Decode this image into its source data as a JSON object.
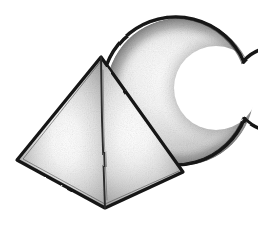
{
  "artwork": {
    "title": "Pencil sketch of a pyramid and a crescent moon",
    "medium": "graphite pencil drawing",
    "background_color": "#ffffff",
    "ink_color": "#1a1a1a",
    "canvas": {
      "width": 258,
      "height": 225
    },
    "objects": [
      {
        "name": "crescent-moon",
        "label": "Crescent moon",
        "description": "Thick crescent opening to the right, drawn behind the pyramid",
        "fill_light": "#fdfdfd",
        "fill_mid": "#cfcfcf",
        "fill_dark": "#9a9a9a",
        "outline_color": "#141414",
        "outline_width": 3.4,
        "outer_circle": {
          "cx": 180,
          "cy": 92,
          "r": 74
        },
        "inner_circle": {
          "cx": 216,
          "cy": 88,
          "r": 42
        },
        "horn_upper_tip": {
          "x": 246,
          "y": 62
        },
        "horn_lower_tip": {
          "x": 244,
          "y": 118
        }
      },
      {
        "name": "pyramid",
        "label": "Square pyramid",
        "description": "Three-quarter view square pyramid with two visible faces",
        "apex": {
          "x": 101,
          "y": 57
        },
        "left_vertex": {
          "x": 17,
          "y": 160
        },
        "bottom_vertex": {
          "x": 105,
          "y": 208
        },
        "right_vertex": {
          "x": 183,
          "y": 172
        },
        "left_face_light": "#f7f7f7",
        "left_face_mid": "#d4d4d4",
        "left_face_dark": "#a8a8a8",
        "right_face_light": "#fbfbfb",
        "right_face_mid": "#dedede",
        "right_face_dark": "#b4b4b4",
        "outline_color": "#151515",
        "outline_width": 3.2,
        "front_edge_color": "#2a2a2a",
        "front_edge_width": 1.8
      }
    ],
    "shading_notes": [
      "Graphite grain texture across both shapes",
      "Strong specular highlight near the center of each pyramid face",
      "Crescent is darkest along its outer left rim and inner right rim",
      "Double-stroked, slightly wobbly hand-drawn contour lines"
    ]
  }
}
